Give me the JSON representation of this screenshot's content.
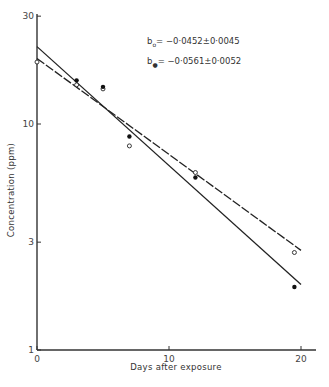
{
  "chart_data": {
    "type": "scatter",
    "title": "",
    "xlabel": "Days after exposure",
    "ylabel": "Concentration (ppm)",
    "xlim": [
      0,
      21
    ],
    "ylim": [
      1,
      40
    ],
    "yscale": "log",
    "x_ticks": [
      "0",
      "10",
      "20"
    ],
    "y_ticks": [
      "1",
      "3",
      "10",
      "30"
    ],
    "grid": false,
    "annotations": [
      {
        "symbol": "open",
        "text": "b",
        "sub": "o",
        "value": "= −0·0452±0·0045"
      },
      {
        "symbol": "filled",
        "text": "b",
        "sub": "●",
        "value": "= −0·0561±0·0052"
      }
    ],
    "series": [
      {
        "name": "open circles",
        "marker": "open",
        "x": [
          0,
          3,
          5,
          7,
          12,
          19.5
        ],
        "y": [
          18.8,
          14.9,
          14.3,
          8.0,
          6.1,
          2.7
        ],
        "fit": {
          "style": "dashed",
          "slope": -0.0452,
          "x": [
            0,
            20
          ],
          "y": [
            19.5,
            2.76
          ]
        }
      },
      {
        "name": "filled circles",
        "marker": "filled",
        "x": [
          3,
          5,
          7,
          12,
          19.5
        ],
        "y": [
          15.6,
          14.6,
          8.8,
          5.8,
          1.9
        ],
        "fit": {
          "style": "solid",
          "slope": -0.0561,
          "x": [
            0,
            20
          ],
          "y": [
            22,
            1.95
          ]
        }
      }
    ]
  }
}
